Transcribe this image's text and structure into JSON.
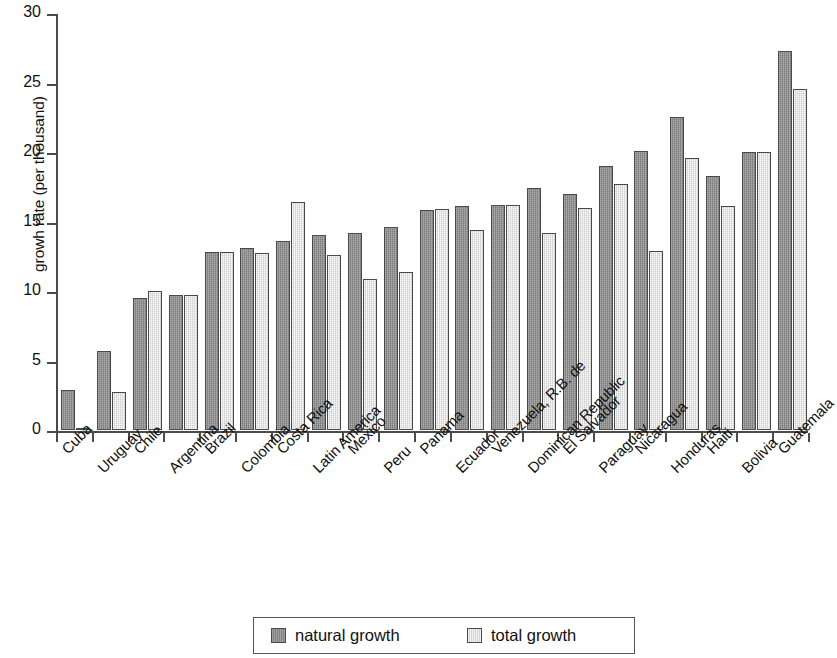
{
  "chart_data": {
    "type": "bar",
    "title": "",
    "xlabel": "",
    "ylabel": "growh rate (per thousand)",
    "ylim": [
      0,
      30
    ],
    "ytick_labels": [
      "0",
      "5",
      "10",
      "15",
      "20",
      "25",
      "30"
    ],
    "ytick_values": [
      0,
      5,
      10,
      15,
      20,
      25,
      30
    ],
    "grid": false,
    "legend_position": "bottom",
    "categories": [
      "Cuba",
      "Uruguay",
      "Chile",
      "Argentina",
      "Brazil",
      "Colombia",
      "Costa Rica",
      "Latin America",
      "Mexico",
      "Peru",
      "Panama",
      "Ecuador",
      "Venezuela, R.B. de",
      "Dominican Republic",
      "El Salvador",
      "Paraguay",
      "Nicaragua",
      "Honduras",
      "Haiti",
      "Bolivia",
      "Guatemala"
    ],
    "series": [
      {
        "name": "natural growth",
        "color": "#8d8d8d",
        "values": [
          2.9,
          5.7,
          9.5,
          9.7,
          12.8,
          13.1,
          13.6,
          14.0,
          14.2,
          14.6,
          15.8,
          16.1,
          16.2,
          17.4,
          17.0,
          19.0,
          20.1,
          22.5,
          18.3,
          20.0,
          27.3
        ]
      },
      {
        "name": "total growth",
        "color": "#e2e2e2",
        "values": [
          0.1,
          2.7,
          10.0,
          9.7,
          12.8,
          12.7,
          16.4,
          12.6,
          10.9,
          11.4,
          15.9,
          14.4,
          16.2,
          14.2,
          16.0,
          17.7,
          12.9,
          19.6,
          16.1,
          20.0,
          24.5
        ]
      }
    ]
  },
  "legend": {
    "entries": [
      {
        "label": "natural growth"
      },
      {
        "label": "total growth"
      }
    ]
  }
}
